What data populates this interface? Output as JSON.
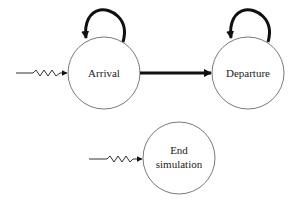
{
  "diagram": {
    "type": "event-graph",
    "colors": {
      "background": "#ffffff",
      "node_stroke": "#7a7a7a",
      "edge": "#111111",
      "text": "#222222"
    },
    "nodes": [
      {
        "id": "arrival",
        "label": "Arrival",
        "cx": 104,
        "cy": 73,
        "r": 36,
        "self_loop": true,
        "external_trigger": true
      },
      {
        "id": "departure",
        "label": "Departure",
        "cx": 248,
        "cy": 73,
        "r": 36,
        "self_loop": true,
        "external_trigger": false
      },
      {
        "id": "end_simulation",
        "label_lines": [
          "End",
          "simulation"
        ],
        "cx": 179,
        "cy": 158,
        "r": 36,
        "self_loop": false,
        "external_trigger": true
      }
    ],
    "edges": [
      {
        "from": "arrival",
        "to": "arrival",
        "style": "bold-self-loop"
      },
      {
        "from": "arrival",
        "to": "departure",
        "style": "bold-arrow"
      },
      {
        "from": "departure",
        "to": "departure",
        "style": "bold-self-loop"
      },
      {
        "from": "external",
        "to": "arrival",
        "style": "zigzag-arrow"
      },
      {
        "from": "external",
        "to": "end_simulation",
        "style": "zigzag-arrow"
      }
    ]
  }
}
